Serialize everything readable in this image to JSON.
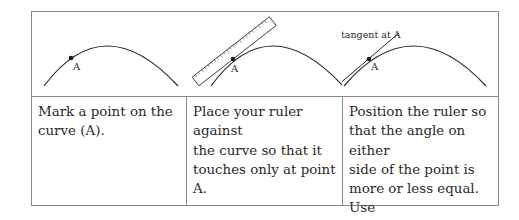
{
  "table": {
    "columns": [
      {
        "figure": {
          "point_label": "A",
          "annotation": ""
        },
        "text": "Mark a point on the\ncurve (A)."
      },
      {
        "figure": {
          "point_label": "A",
          "annotation": "",
          "tool": "ruler-icon"
        },
        "text": "Place your ruler against\nthe curve so that it\ntouches only at point A."
      },
      {
        "figure": {
          "point_label": "A",
          "annotation": "tangent at A"
        },
        "text": "Position the ruler so\nthat the angle on either\nside of the point is\nmore or less equal. Use\na pencil to draw the\ntangent."
      }
    ]
  },
  "colors": {
    "border": "#8a8a8a",
    "curve": "#2a2a2a",
    "text": "#2a2a2a"
  }
}
